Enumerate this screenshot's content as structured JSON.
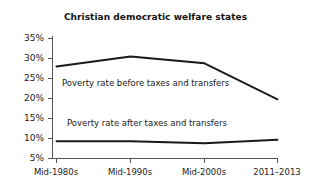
{
  "chart_data": {
    "type": "line",
    "title": "Christian democratic welfare states",
    "xlabel": "",
    "ylabel": "",
    "categories": [
      "Mid-1980s",
      "Mid-1990s",
      "Mid-2000s",
      "2011–2013"
    ],
    "ylim": [
      5,
      35
    ],
    "ytick_values": [
      35,
      30,
      25,
      20,
      15,
      10,
      5
    ],
    "ytick_labels": [
      "35%",
      "30%",
      "25%",
      "20%",
      "15%",
      "10%",
      "5%"
    ],
    "grid": false,
    "legend_position": "inline-annotation",
    "series": [
      {
        "name": "Poverty rate before taxes and transfers",
        "values": [
          28.0,
          30.5,
          28.8,
          19.8
        ]
      },
      {
        "name": "Poverty rate after taxes and transfers",
        "values": [
          9.3,
          9.3,
          8.8,
          9.7
        ]
      }
    ],
    "annotations": [
      "Poverty rate before taxes and transfers",
      "Poverty rate after taxes and transfers"
    ],
    "line_color": "#1a1a1a"
  }
}
